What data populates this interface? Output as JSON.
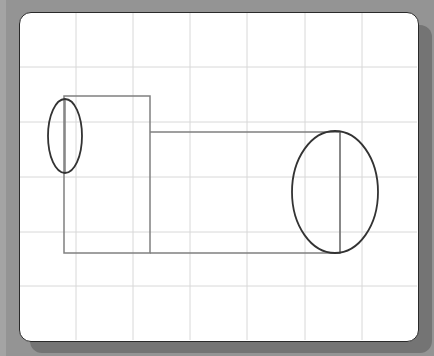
{
  "canvas": {
    "width": 434,
    "height": 356,
    "background_color": "#949494",
    "panel_color": "#ffffff",
    "border_color": "#2a2a2a",
    "grid_color": "#d8d8d8",
    "shape_color": "#808080",
    "ellipse_color": "#333333"
  },
  "grid": {
    "vertical_x": [
      76,
      133,
      190,
      247,
      305,
      362
    ],
    "horizontal_y": [
      67,
      122,
      177,
      232,
      286
    ]
  },
  "shapes": {
    "rect_left": {
      "x": 64,
      "y": 96,
      "width": 86,
      "height": 157
    },
    "rect_right": {
      "x": 150,
      "y": 132,
      "width": 190,
      "height": 121
    },
    "ellipse_left": {
      "cx": 65,
      "cy": 136,
      "rx": 17,
      "ry": 37
    },
    "ellipse_right": {
      "cx": 335,
      "cy": 192,
      "rx": 43,
      "ry": 61
    },
    "axis_line_left": {
      "x": 65,
      "y1": 99,
      "y2": 173
    },
    "axis_line_right": {
      "x": 340,
      "y1": 132,
      "y2": 253
    }
  }
}
